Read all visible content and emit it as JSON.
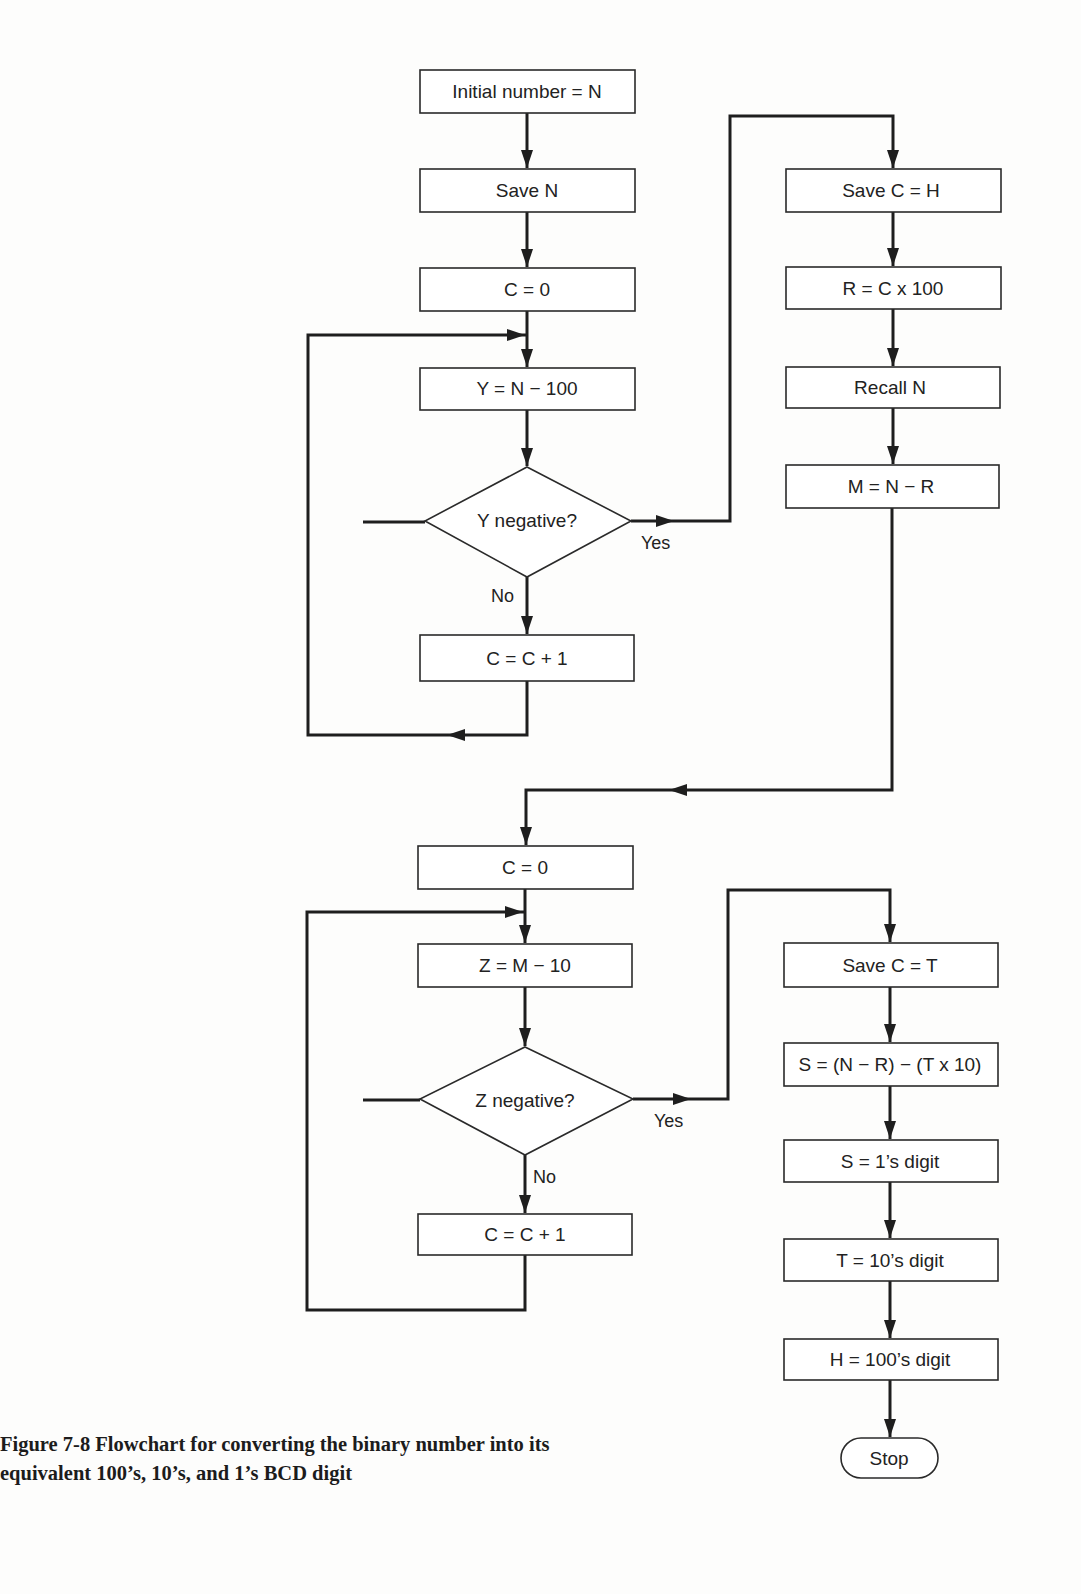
{
  "figure": {
    "caption_line1": "Figure 7-8 Flowchart for converting the binary number into its",
    "caption_line2": "equivalent 100’s, 10’s, and 1’s BCD digit"
  },
  "hundreds_loop": {
    "initial": "Initial number = N",
    "save_n": "Save N",
    "c_zero": "C = 0",
    "y_calc": "Y = N − 100",
    "decision": "Y negative?",
    "yes_label": "Yes",
    "no_label": "No",
    "increment": "C = C + 1"
  },
  "hundreds_result": {
    "save_h": "Save C = H",
    "r_calc": "R = C x 100",
    "recall_n": "Recall N",
    "m_calc": "M = N − R"
  },
  "tens_loop": {
    "c_zero": "C = 0",
    "z_calc": "Z = M − 10",
    "decision": "Z negative?",
    "yes_label": "Yes",
    "no_label": "No",
    "increment": "C = C + 1"
  },
  "tens_result": {
    "save_t": "Save C = T",
    "s_calc": "S = (N − R) − (T x 10)",
    "ones_digit": "S = 1’s digit",
    "tens_digit": "T = 10’s digit",
    "hundreds_digit": "H = 100’s digit",
    "stop": "Stop"
  }
}
